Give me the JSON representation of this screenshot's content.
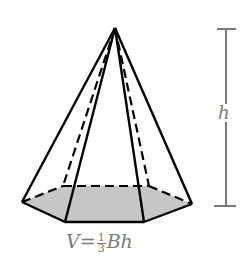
{
  "diagram": {
    "height_label": "h",
    "formula": {
      "lhs": "V",
      "eq": "=",
      "frac_num": "1",
      "frac_den": "3",
      "rhs": "Bh"
    },
    "colors": {
      "edge": "#000000",
      "base_fill": "#c8c8c8",
      "annotation": "#7a7a7a"
    }
  }
}
